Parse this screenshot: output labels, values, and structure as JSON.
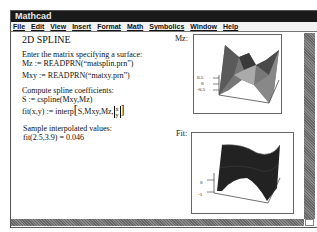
{
  "window": {
    "title": "Mathcad"
  },
  "menu": {
    "items": [
      "File",
      "Edit",
      "View",
      "Insert",
      "Format",
      "Math",
      "Symbolics",
      "Window",
      "Help"
    ]
  },
  "worksheet": {
    "heading": "2D SPLINE",
    "lines": [
      "Enter the matrix specifying a surface:",
      "Mz := READPRN(“matsplin.prn”)",
      "Mxy := READPRN(“matxy.prn”)",
      "Compute spline coefficients:",
      "S := cspline(Mxy,Mz)",
      "fit(x,y) := interp(S,Mxy,Mz,[x; y])",
      "Sample interpolated values:",
      "fit(2.5,3.9) = 0.046"
    ],
    "fit_def_prefix": "fit(x,y) := interp",
    "fit_def_args": "S,Mxy,Mz,",
    "fit_vec_x": "x",
    "fit_vec_y": "y"
  },
  "plots": {
    "mz": {
      "label": "Mz:",
      "ticks": [
        "0.5",
        "0",
        "-0.5"
      ]
    },
    "fit": {
      "label": "Fit:",
      "ticks": [
        "0",
        "-1"
      ]
    }
  },
  "colors": {
    "titlebar": "#1a1a1a",
    "scrollbar": "#777777"
  }
}
